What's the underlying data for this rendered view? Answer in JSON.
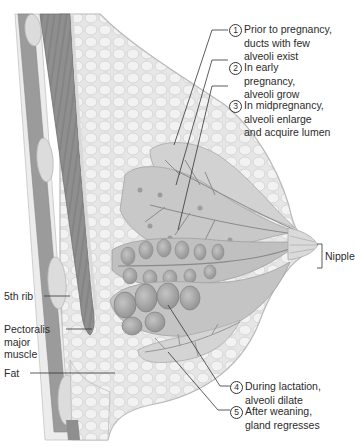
{
  "figure": {
    "colors": {
      "background": "#ffffff",
      "fat_tissue": "#e4e4e4",
      "fat_lobule_outline": "#c9c9c9",
      "muscle": "#8c8c8c",
      "rib": "#d8d8d8",
      "gland": "#bdbdbd",
      "alveoli_dark": "#9a9a9a",
      "leader_line": "#333333",
      "text": "#2b2b2b"
    }
  },
  "callouts_right": [
    {
      "number": "1",
      "lines": [
        "Prior to pregnancy,",
        "ducts with few",
        "alveoli exist"
      ]
    },
    {
      "number": "2",
      "lines": [
        "In early",
        "pregnancy,",
        "alveoli grow"
      ]
    },
    {
      "number": "3",
      "lines": [
        "In midpregnancy,",
        "alveoli enlarge",
        "and acquire lumen"
      ]
    },
    {
      "number": "4",
      "lines": [
        "During lactation,",
        "alveoli dilate"
      ]
    },
    {
      "number": "5",
      "lines": [
        "After weaning,",
        "gland regresses"
      ]
    }
  ],
  "labels_left": [
    {
      "id": "rib",
      "lines": [
        "5th rib"
      ]
    },
    {
      "id": "muscle",
      "lines": [
        "Pectoralis",
        "major",
        "muscle"
      ]
    },
    {
      "id": "fat",
      "lines": [
        "Fat"
      ]
    }
  ],
  "nipple_label": "Nipple"
}
